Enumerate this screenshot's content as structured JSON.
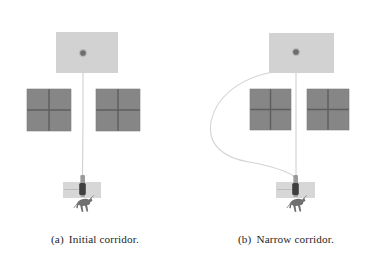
{
  "figure": {
    "background_color": "#ffffff",
    "panels": [
      {
        "id": "panel-a",
        "caption_tag": "(a)",
        "caption_text": "Initial corridor.",
        "goal_region": {
          "x": 56,
          "y": 32,
          "width": 62,
          "height": 41,
          "color": "#d2d2d2"
        },
        "goal_point": {
          "cx": 83,
          "cy": 53,
          "r": 3.2,
          "color": "#6e6e6e"
        },
        "obstacles": [
          {
            "name": "left-obstacle",
            "x": 27,
            "y": 89,
            "width": 44,
            "height": 42,
            "color": "#868686",
            "grid_color": "#5d5d5d"
          },
          {
            "name": "right-obstacle",
            "x": 96,
            "y": 89,
            "width": 44,
            "height": 42,
            "color": "#868686",
            "grid_color": "#5d5d5d"
          }
        ],
        "corridor_gap_px": 25,
        "start_region": {
          "x": 63,
          "y": 182,
          "width": 38,
          "height": 16,
          "color": "#d7d7d7"
        },
        "robot_body": {
          "x": 78,
          "y": 175,
          "width": 7,
          "height": 24,
          "color": "#4a4a4a"
        },
        "robot_sketch": {
          "cx": 84,
          "cy": 207,
          "scale": 1.0,
          "color": "#6a6a6a"
        },
        "path": {
          "color": "#cfcfcf",
          "width": 1.1,
          "d": "M 83 56 L 83 120 L 82.5 176"
        }
      },
      {
        "id": "panel-b",
        "caption_tag": "(b)",
        "caption_text": "Narrow corridor.",
        "goal_region": {
          "x": 78,
          "y": 33,
          "width": 65,
          "height": 40,
          "color": "#d2d2d2"
        },
        "goal_point": {
          "cx": 105,
          "cy": 52,
          "r": 3.2,
          "color": "#6e6e6e"
        },
        "obstacles": [
          {
            "name": "left-obstacle",
            "x": 59,
            "y": 89,
            "width": 41,
            "height": 41,
            "color": "#868686",
            "grid_color": "#5d5d5d"
          },
          {
            "name": "right-obstacle",
            "x": 116,
            "y": 89,
            "width": 42,
            "height": 41,
            "color": "#868686",
            "grid_color": "#5d5d5d"
          }
        ],
        "corridor_gap_px": 16,
        "start_region": {
          "x": 85,
          "y": 182,
          "width": 39,
          "height": 16,
          "color": "#d7d7d7"
        },
        "robot_body": {
          "x": 100,
          "y": 175,
          "width": 7,
          "height": 24,
          "color": "#4a4a4a"
        },
        "robot_sketch": {
          "cx": 106,
          "cy": 207,
          "scale": 1.0,
          "color": "#6a6a6a"
        },
        "path": {
          "color": "#cfcfcf",
          "width": 1.1,
          "d": "M 105 56 L 105 130 L 105 176"
        },
        "detour_path": {
          "color": "#d4d4d4",
          "width": 1.1,
          "d": "M 101 71 C 60 70 26 92 20 122 C 16 146 34 158 58 162 C 80 166 96 171 104 177"
        }
      }
    ]
  }
}
